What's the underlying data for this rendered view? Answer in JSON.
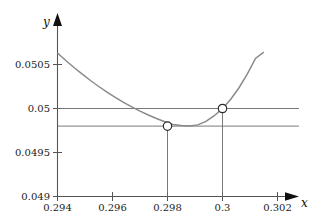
{
  "chart_data": {
    "type": "line",
    "title": "",
    "subtitle": "",
    "xlabel": "x",
    "ylabel": "y",
    "xlim": [
      0.294,
      0.302
    ],
    "ylim": [
      0.049,
      0.0505
    ],
    "grid": false,
    "legend": null,
    "x_ticks": [
      {
        "value": 0.294,
        "label": "0.294"
      },
      {
        "value": 0.296,
        "label": "0.296"
      },
      {
        "value": 0.298,
        "label": "0.298"
      },
      {
        "value": 0.3,
        "label": "0.3"
      },
      {
        "value": 0.302,
        "label": "0.302"
      }
    ],
    "y_ticks": [
      {
        "value": 0.049,
        "label": "0.049"
      },
      {
        "value": 0.0495,
        "label": "0.0495"
      },
      {
        "value": 0.05,
        "label": "0.05"
      },
      {
        "value": 0.0505,
        "label": "0.0505"
      }
    ],
    "series": [
      {
        "name": "curve",
        "type": "line",
        "color": "#8a8a8a",
        "x": [
          0.294,
          0.2943,
          0.2946,
          0.2949,
          0.2952,
          0.2955,
          0.2958,
          0.2961,
          0.2964,
          0.2967,
          0.297,
          0.2973,
          0.2976,
          0.2979,
          0.2982,
          0.2985,
          0.2988,
          0.2991,
          0.2994,
          0.2997,
          0.3,
          0.3003,
          0.3006,
          0.3009,
          0.3012,
          0.3015
        ],
        "y": [
          0.05063,
          0.050546,
          0.050466,
          0.05039,
          0.050318,
          0.05025,
          0.050186,
          0.050126,
          0.05007,
          0.050018,
          0.04997,
          0.049926,
          0.049886,
          0.04985,
          0.049818,
          0.049808,
          0.049802,
          0.049814,
          0.049854,
          0.049918,
          0.05,
          0.050106,
          0.050236,
          0.05039,
          0.050568,
          0.05064
        ]
      }
    ],
    "reference_lines": [
      {
        "name": "y-level-0.05",
        "orientation": "horizontal",
        "value": 0.05
      },
      {
        "name": "y-level-0.0498",
        "orientation": "horizontal",
        "value": 0.0498
      }
    ],
    "drop_lines": [
      {
        "name": "drop-at-0.298",
        "orientation": "vertical",
        "x": 0.298,
        "from_y": 0.0498,
        "to_y": 0.049
      },
      {
        "name": "drop-at-0.3",
        "orientation": "vertical",
        "x": 0.3,
        "from_y": 0.05,
        "to_y": 0.049
      }
    ],
    "markers": [
      {
        "name": "minimum-point",
        "x": 0.298,
        "y": 0.0498,
        "style": "open-circle"
      },
      {
        "name": "point-at-0.3",
        "x": 0.3,
        "y": 0.05,
        "style": "open-circle"
      }
    ],
    "annotations": []
  }
}
